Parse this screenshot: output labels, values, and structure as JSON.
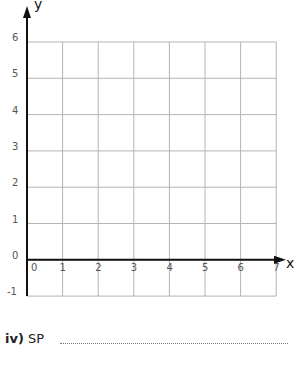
{
  "chart_data": {
    "type": "scatter",
    "title": "",
    "xlabel": "x",
    "ylabel": "y",
    "xlim": [
      0,
      7
    ],
    "ylim": [
      -1,
      6
    ],
    "grid": true,
    "x_ticks": [
      "0",
      "1",
      "2",
      "3",
      "4",
      "5",
      "6",
      "7"
    ],
    "y_ticks": [
      "-1",
      "0",
      "1",
      "2",
      "3",
      "4",
      "5",
      "6"
    ],
    "series": []
  },
  "question": {
    "number": "iv)",
    "label": "SP"
  },
  "colors": {
    "grid": "#b5b5b5",
    "axis": "#111111"
  }
}
